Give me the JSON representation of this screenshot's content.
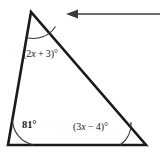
{
  "figure": {
    "kind": "triangle-angle-diagram",
    "background_color": "#ffffff",
    "stroke_color": "#1a1a1a",
    "arc_color": "#333333",
    "arrow_color": "#3a3a3a"
  },
  "labels": {
    "apex_angle": "(2x + 3)°",
    "apex_angle_prefix": "(2",
    "apex_angle_var": "x",
    "apex_angle_suffix": " + 3)°",
    "bottom_left_angle": "81°",
    "bottom_right_angle": "(3x − 4)°",
    "bottom_right_prefix": "(3",
    "bottom_right_var": "x",
    "bottom_right_suffix": " − 4)°"
  },
  "geometry": {
    "vertices": {
      "apex": {
        "x": 31,
        "y": 12
      },
      "bottom_left": {
        "x": 8,
        "y": 145
      },
      "bottom_right": {
        "x": 146,
        "y": 145
      }
    },
    "side_width": 2.5,
    "arcs": {
      "apex_radius": 26,
      "bottom_left_radius": 26,
      "bottom_right_radius": 26
    }
  },
  "annotation": {
    "arrow": {
      "name": "callout-arrow",
      "direction": "left",
      "tip": {
        "x": 66,
        "y": 14
      },
      "tail": {
        "x": 160,
        "y": 14
      },
      "head_length": 11,
      "head_half_height": 4.5,
      "shaft_width": 1.4
    }
  },
  "chart_data": {
    "type": "diagram",
    "shape": "triangle",
    "angles": [
      {
        "vertex": "apex",
        "label": "(2x + 3)°",
        "position": "top-left"
      },
      {
        "vertex": "bottom-left",
        "label": "81°",
        "position": "bottom-left"
      },
      {
        "vertex": "bottom-right",
        "label": "(3x − 4)°",
        "position": "bottom-right"
      }
    ],
    "annotations": [
      "left-pointing arrow at top right"
    ]
  }
}
